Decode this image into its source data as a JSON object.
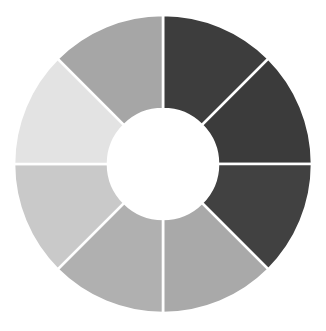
{
  "chart_data": {
    "type": "pie",
    "variant": "donut",
    "title": "",
    "subtitle": "",
    "xlabel": "",
    "ylabel": "",
    "legend": false,
    "legend_position": "none",
    "grid": false,
    "labels_shown": false,
    "tick_labels": [],
    "annotations": [],
    "background_color": "#ffffff",
    "segment_gap_color": "#ffffff",
    "segment_gap_width_px": 2.6,
    "center_x_px": 163,
    "center_y_px": 164,
    "outer_radius_px": 149,
    "inner_radius_px": 55,
    "inner_radius_ratio": 0.369,
    "start_angle_deg": 0,
    "direction": "clockwise",
    "categories": [
      "Segment 1",
      "Segment 2",
      "Segment 3",
      "Segment 4",
      "Segment 5",
      "Segment 6",
      "Segment 7",
      "Segment 8"
    ],
    "values": [
      12.5,
      12.5,
      12.5,
      12.5,
      12.5,
      12.5,
      12.5,
      12.5
    ],
    "percentages": [
      12.5,
      12.5,
      12.5,
      12.5,
      12.5,
      12.5,
      12.5,
      12.5
    ],
    "colors": [
      "#3d3d3d",
      "#3b3b3b",
      "#414141",
      "#a9a9a9",
      "#b0b0b0",
      "#c9c9c9",
      "#e3e3e3",
      "#a6a6a6"
    ],
    "segments": [
      {
        "label": "Segment 1",
        "value": 12.5,
        "percent": 12.5,
        "color": "#3d3d3d",
        "start_angle_deg": 0,
        "end_angle_deg": 45,
        "position": "top-right-upper"
      },
      {
        "label": "Segment 2",
        "value": 12.5,
        "percent": 12.5,
        "color": "#3b3b3b",
        "start_angle_deg": 45,
        "end_angle_deg": 90,
        "position": "right-upper"
      },
      {
        "label": "Segment 3",
        "value": 12.5,
        "percent": 12.5,
        "color": "#414141",
        "start_angle_deg": 90,
        "end_angle_deg": 135,
        "position": "right-lower"
      },
      {
        "label": "Segment 4",
        "value": 12.5,
        "percent": 12.5,
        "color": "#a9a9a9",
        "start_angle_deg": 135,
        "end_angle_deg": 180,
        "position": "bottom-right"
      },
      {
        "label": "Segment 5",
        "value": 12.5,
        "percent": 12.5,
        "color": "#b0b0b0",
        "start_angle_deg": 180,
        "end_angle_deg": 225,
        "position": "bottom-left"
      },
      {
        "label": "Segment 6",
        "value": 12.5,
        "percent": 12.5,
        "color": "#c9c9c9",
        "start_angle_deg": 225,
        "end_angle_deg": 270,
        "position": "left-lower"
      },
      {
        "label": "Segment 7",
        "value": 12.5,
        "percent": 12.5,
        "color": "#e3e3e3",
        "start_angle_deg": 270,
        "end_angle_deg": 315,
        "position": "left-upper"
      },
      {
        "label": "Segment 8",
        "value": 12.5,
        "percent": 12.5,
        "color": "#a6a6a6",
        "start_angle_deg": 315,
        "end_angle_deg": 360,
        "position": "top-left"
      }
    ]
  }
}
